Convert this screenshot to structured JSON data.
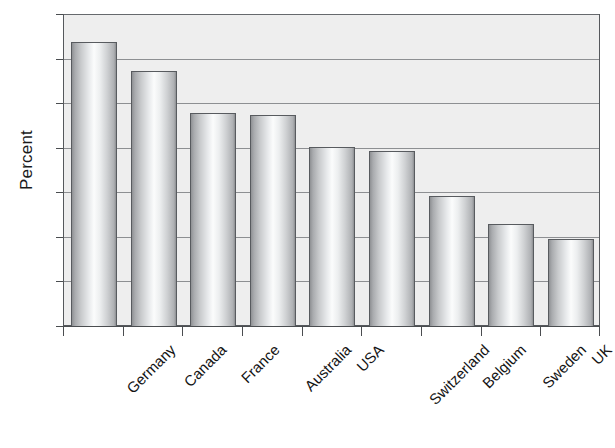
{
  "chart_data": {
    "type": "bar",
    "title": "",
    "xlabel": "",
    "ylabel": "Percent",
    "categories": [
      "Germany",
      "Canada",
      "France",
      "Australia",
      "USA",
      "Switzerland",
      "Belgium",
      "Sweden",
      "UK"
    ],
    "values": [
      64,
      57.4,
      48,
      47.5,
      40.3,
      39.5,
      29.5,
      23,
      19.7
    ],
    "ylim": [
      0,
      70
    ],
    "ytick_step": 10,
    "yticks": [
      0,
      10,
      20,
      30,
      40,
      50,
      60,
      70
    ],
    "ytick_labels": [
      "0",
      "10",
      "20",
      "30",
      "40",
      "50",
      "60",
      "70"
    ],
    "grid": true,
    "grid_axis": "y",
    "legend": false,
    "legend_position": "none",
    "xtick_rotation": -45,
    "bar_style": "3d-cylinder",
    "colors": {
      "plot_background": "#eeeeee",
      "figure_background": "#ffffff",
      "bar_highlight": "#fbfcfc",
      "bar_shadow": "#8d8f92",
      "bar_outline": "#585b5f",
      "gridline": "#6c6f73",
      "axis": "#4a4d50",
      "text": "#111111"
    }
  }
}
